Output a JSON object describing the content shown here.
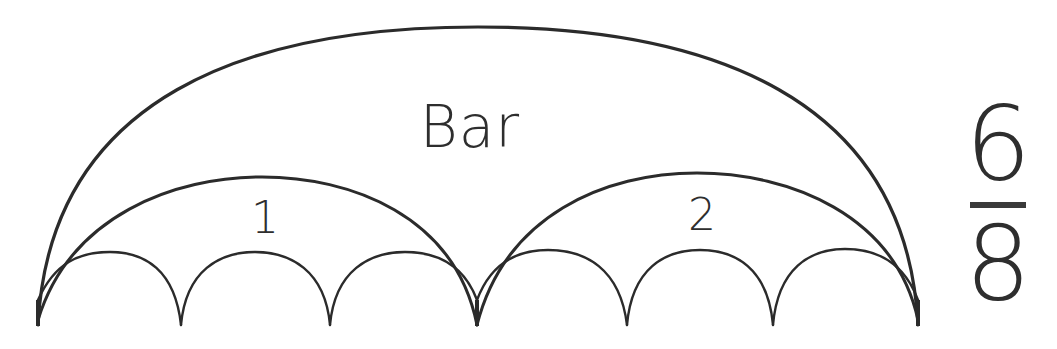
{
  "diagram": {
    "type": "rhythm-arc-diagram",
    "bar_label": "Bar",
    "beat_labels": [
      "1",
      "2"
    ],
    "time_signature": {
      "numerator": "6",
      "denominator": "8"
    },
    "structure": {
      "bar_arcs": 1,
      "beat_group_arcs": 2,
      "subdivision_arcs": 6,
      "subdivisions_per_beat": 3
    },
    "colors": {
      "stroke": "#2b2b2b",
      "text": "#2e2e2e",
      "background": "#ffffff"
    }
  }
}
